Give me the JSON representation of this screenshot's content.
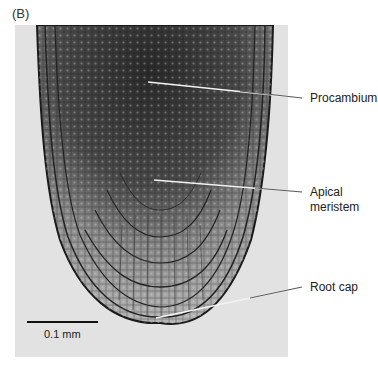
{
  "figure": {
    "panel_label": "(B)",
    "labels": {
      "procambium": "Procambium",
      "apical_meristem_line1": "Apical",
      "apical_meristem_line2": "meristem",
      "root_cap": "Root cap"
    },
    "scale_bar": {
      "label": "0.1 mm"
    },
    "colors": {
      "background": "#ffffff",
      "photo_background": "#e2e2e2",
      "tissue_dark": "#2a2a2a",
      "tissue_light": "#b8b8b8",
      "leader_line": "#333333"
    }
  }
}
